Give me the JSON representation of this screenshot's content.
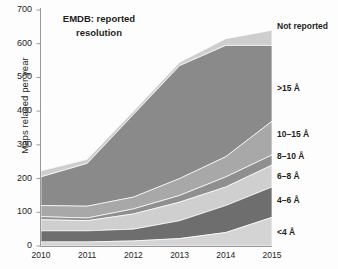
{
  "chart_data": {
    "type": "area",
    "title": "EMDB: reported resolution",
    "title_lines": [
      "EMDB: reported",
      "resolution"
    ],
    "xlabel": "",
    "ylabel": "Maps relased per year",
    "x": [
      2010,
      2011,
      2012,
      2013,
      2014,
      2015
    ],
    "xtick_labels": [
      "2010",
      "2011",
      "2012",
      "2013",
      "2014",
      "2015"
    ],
    "ytick_labels": [
      "0",
      "100",
      "200",
      "300",
      "400",
      "500",
      "600",
      "700"
    ],
    "yticks": [
      0,
      100,
      200,
      300,
      400,
      500,
      600,
      700
    ],
    "ylim": [
      0,
      700
    ],
    "xlim": [
      2010,
      2015
    ],
    "grid": false,
    "stacked": true,
    "legend_position": "right-inline",
    "series": [
      {
        "name": "<4 Å",
        "label": "<4 Å",
        "color": "#d4d4d4",
        "values": [
          12,
          12,
          15,
          22,
          40,
          85
        ]
      },
      {
        "name": "4–6 Å",
        "label": "4–6 Å",
        "color": "#6e6e6e",
        "values": [
          33,
          33,
          35,
          53,
          80,
          90
        ]
      },
      {
        "name": "6–8 Å",
        "label": "6–8 Å",
        "color": "#cfcfcf",
        "values": [
          33,
          30,
          45,
          55,
          55,
          65
        ]
      },
      {
        "name": "8–10 Å",
        "label": "8–10 Å",
        "color": "#8f8f8f",
        "values": [
          9,
          8,
          15,
          20,
          30,
          30
        ]
      },
      {
        "name": "10–15 Å",
        "label": "10–15 Å",
        "color": "#a8a8a8",
        "values": [
          33,
          35,
          35,
          50,
          60,
          100
        ]
      },
      {
        "name": ">15 Å",
        "label": ">15 Å",
        "color": "#8a8a8a",
        "values": [
          85,
          127,
          245,
          335,
          330,
          225
        ]
      },
      {
        "name": "Not reported",
        "label": "Not reported",
        "color": "#cecece",
        "values": [
          18,
          12,
          10,
          10,
          20,
          45
        ]
      }
    ],
    "cumulative_tops": {
      "2010": [
        12,
        45,
        78,
        87,
        120,
        205,
        223
      ],
      "2011": [
        12,
        45,
        75,
        83,
        118,
        245,
        257
      ],
      "2012": [
        15,
        50,
        95,
        110,
        145,
        390,
        400
      ],
      "2013": [
        22,
        75,
        130,
        150,
        200,
        535,
        545
      ],
      "2014": [
        40,
        120,
        175,
        205,
        265,
        595,
        615
      ],
      "2015": [
        85,
        175,
        240,
        270,
        370,
        595,
        640
      ]
    },
    "axis_color": "#9a9a9a",
    "text_color": "#231f20",
    "background": "#fdfdfd"
  }
}
